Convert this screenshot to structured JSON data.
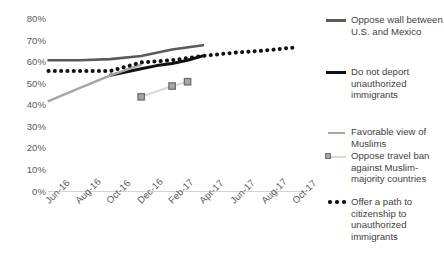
{
  "chart_data": {
    "type": "line",
    "title": "",
    "subtitle": "",
    "xlabel": "",
    "ylabel": "",
    "ylim": [
      0,
      80
    ],
    "ytick_labels": [
      "0%",
      "10%",
      "20%",
      "30%",
      "40%",
      "50%",
      "60%",
      "70%",
      "80%"
    ],
    "ytick_values": [
      0,
      10,
      20,
      30,
      40,
      50,
      60,
      70,
      80
    ],
    "xtick_labels": [
      "Jun-16",
      "Aug-16",
      "Oct-16",
      "Dec-16",
      "Feb-17",
      "Apr-17",
      "Jun-17",
      "Aug-17",
      "Oct-17"
    ],
    "grid": false,
    "legend_position": "right",
    "series": [
      {
        "name": "Oppose wall between U.S. and Mexico",
        "style": "solid",
        "color": "#5a5a5c",
        "width": 2.6,
        "x": [
          "Jun-16",
          "Aug-16",
          "Oct-16",
          "Dec-16",
          "Feb-17",
          "Apr-17"
        ],
        "values": [
          61,
          61,
          61.5,
          63,
          66,
          68
        ]
      },
      {
        "name": "Do not deport unauthorized immigrants",
        "style": "solid",
        "color": "#111111",
        "width": 3.0,
        "x": [
          "Oct-16",
          "Nov-16",
          "Dec-16",
          "Jan-17",
          "Feb-17",
          "Mar-17",
          "Apr-17"
        ],
        "values": [
          54,
          55.5,
          57,
          58.5,
          59.5,
          61,
          63
        ]
      },
      {
        "name": "Favorable view of Muslims",
        "style": "solid",
        "color": "#a6a6a6",
        "width": 2.4,
        "x": [
          "Jun-16",
          "Aug-16",
          "Oct-16",
          "Dec-16"
        ],
        "values": [
          42,
          48,
          54,
          59
        ]
      },
      {
        "name": "Oppose travel ban against Muslim-majority countries",
        "style": "solid-markers",
        "color": "#d9d9d9",
        "marker_fill": "#a6a6a6",
        "marker_edge": "#6e6e6e",
        "width": 2.0,
        "x": [
          "Dec-16",
          "Feb-17",
          "Mar-17"
        ],
        "values": [
          44,
          49,
          51
        ]
      },
      {
        "name": "Offer a path to citizenship to unauthorized immigrants",
        "style": "dotted",
        "color": "#111111",
        "width": 4.0,
        "x": [
          "Jun-16",
          "Aug-16",
          "Oct-16",
          "Dec-16",
          "Feb-17",
          "Apr-17",
          "Jun-17",
          "Aug-17",
          "Oct-17"
        ],
        "values": [
          56,
          56,
          56,
          60,
          61,
          63,
          64.5,
          65.5,
          67
        ]
      }
    ]
  },
  "legend": {
    "entries": [
      {
        "label": "Oppose wall between U.S. and Mexico",
        "marker": "line-dark-gray"
      },
      {
        "label": "Do not deport unauthorized immigrants",
        "marker": "line-black"
      },
      {
        "label": "Favorable view of Muslims",
        "marker": "line-light-gray"
      },
      {
        "label": "Oppose travel ban against Muslim-majority countries",
        "marker": "line-square-marker"
      },
      {
        "label": "Offer a path to citizenship to unauthorized immigrants",
        "marker": "dotted-black"
      }
    ]
  },
  "colors": {
    "oppose_wall": "#5a5a5c",
    "no_deport": "#111111",
    "favorable_muslims": "#a6a6a6",
    "travel_ban": "#d9d9d9",
    "path_citizenship": "#111111",
    "axis": "#d4d4d4",
    "tick_text": "#59595b"
  }
}
